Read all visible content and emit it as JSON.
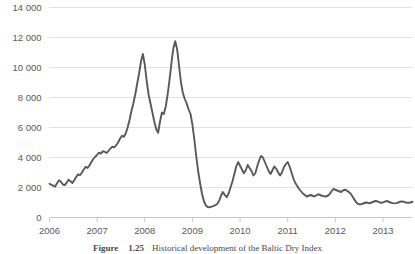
{
  "caption": {
    "label": "Figure",
    "number": "1.25",
    "text": "Historical development of the Baltic Dry Index"
  },
  "chart_data": {
    "type": "line",
    "title": "",
    "xlabel": "",
    "ylabel": "",
    "grid": true,
    "legend": "none",
    "xlim": [
      2006.0,
      2013.62
    ],
    "ylim": [
      0,
      14000
    ],
    "ytick_labels": [
      "0",
      "2 000",
      "4 000",
      "6 000",
      "8 000",
      "10 000",
      "12 000",
      "14 000"
    ],
    "ytick_values": [
      0,
      2000,
      4000,
      6000,
      8000,
      10000,
      12000,
      14000
    ],
    "xtick_labels": [
      "2006",
      "2007",
      "2008",
      "2009",
      "2010",
      "2011",
      "2012",
      "2013"
    ],
    "xtick_values": [
      2006,
      2007,
      2008,
      2009,
      2010,
      2011,
      2012,
      2013
    ],
    "series": [
      {
        "name": "Baltic Dry Index",
        "color": "#595959",
        "x": [
          2006.0,
          2006.04,
          2006.08,
          2006.12,
          2006.16,
          2006.2,
          2006.24,
          2006.28,
          2006.32,
          2006.36,
          2006.4,
          2006.44,
          2006.48,
          2006.52,
          2006.56,
          2006.6,
          2006.64,
          2006.68,
          2006.72,
          2006.76,
          2006.8,
          2006.84,
          2006.88,
          2006.92,
          2006.96,
          2007.0,
          2007.04,
          2007.08,
          2007.12,
          2007.16,
          2007.2,
          2007.24,
          2007.28,
          2007.32,
          2007.36,
          2007.4,
          2007.44,
          2007.48,
          2007.52,
          2007.56,
          2007.6,
          2007.64,
          2007.68,
          2007.72,
          2007.76,
          2007.8,
          2007.84,
          2007.88,
          2007.92,
          2007.96,
          2008.0,
          2008.04,
          2008.08,
          2008.12,
          2008.16,
          2008.2,
          2008.24,
          2008.28,
          2008.32,
          2008.36,
          2008.4,
          2008.44,
          2008.48,
          2008.52,
          2008.56,
          2008.6,
          2008.64,
          2008.68,
          2008.72,
          2008.76,
          2008.8,
          2008.84,
          2008.88,
          2008.92,
          2008.96,
          2009.0,
          2009.04,
          2009.08,
          2009.12,
          2009.16,
          2009.2,
          2009.24,
          2009.28,
          2009.32,
          2009.36,
          2009.4,
          2009.44,
          2009.48,
          2009.52,
          2009.56,
          2009.6,
          2009.64,
          2009.68,
          2009.72,
          2009.76,
          2009.8,
          2009.84,
          2009.88,
          2009.92,
          2009.96,
          2010.0,
          2010.04,
          2010.08,
          2010.12,
          2010.16,
          2010.2,
          2010.24,
          2010.28,
          2010.32,
          2010.36,
          2010.4,
          2010.44,
          2010.48,
          2010.52,
          2010.56,
          2010.6,
          2010.64,
          2010.68,
          2010.72,
          2010.76,
          2010.8,
          2010.84,
          2010.88,
          2010.92,
          2010.96,
          2011.0,
          2011.04,
          2011.08,
          2011.12,
          2011.16,
          2011.2,
          2011.24,
          2011.28,
          2011.32,
          2011.36,
          2011.4,
          2011.44,
          2011.48,
          2011.52,
          2011.56,
          2011.6,
          2011.64,
          2011.68,
          2011.72,
          2011.76,
          2011.8,
          2011.84,
          2011.88,
          2011.92,
          2011.96,
          2012.0,
          2012.04,
          2012.08,
          2012.12,
          2012.16,
          2012.2,
          2012.24,
          2012.28,
          2012.32,
          2012.36,
          2012.4,
          2012.44,
          2012.48,
          2012.52,
          2012.56,
          2012.6,
          2012.64,
          2012.68,
          2012.72,
          2012.76,
          2012.8,
          2012.84,
          2012.88,
          2012.92,
          2012.96,
          2013.0,
          2013.04,
          2013.08,
          2013.12,
          2013.16,
          2013.2,
          2013.24,
          2013.28,
          2013.32,
          2013.36,
          2013.4,
          2013.44,
          2013.48,
          2013.52,
          2013.58,
          2013.62
        ],
        "values": [
          2250,
          2180,
          2120,
          2060,
          2300,
          2480,
          2380,
          2200,
          2160,
          2320,
          2520,
          2420,
          2300,
          2480,
          2700,
          2880,
          2820,
          3000,
          3200,
          3380,
          3300,
          3480,
          3700,
          3900,
          4050,
          4180,
          4320,
          4260,
          4420,
          4380,
          4300,
          4450,
          4600,
          4720,
          4680,
          4820,
          5000,
          5250,
          5450,
          5380,
          5600,
          6000,
          6500,
          7100,
          7600,
          8200,
          8900,
          9600,
          10400,
          10900,
          10200,
          9100,
          8200,
          7600,
          7000,
          6400,
          5900,
          5650,
          6400,
          7000,
          6900,
          7400,
          8200,
          9200,
          10300,
          11300,
          11750,
          11200,
          10100,
          9000,
          8300,
          7900,
          7600,
          7200,
          6900,
          6200,
          5200,
          4100,
          3100,
          2300,
          1600,
          1100,
          820,
          700,
          680,
          720,
          760,
          820,
          900,
          1100,
          1450,
          1700,
          1500,
          1350,
          1600,
          2000,
          2400,
          2900,
          3400,
          3700,
          3450,
          3200,
          2950,
          3150,
          3500,
          3300,
          3100,
          2800,
          2950,
          3400,
          3800,
          4100,
          4000,
          3700,
          3400,
          3100,
          2900,
          3150,
          3400,
          3250,
          3000,
          2800,
          3000,
          3350,
          3550,
          3700,
          3400,
          3000,
          2600,
          2300,
          2100,
          1900,
          1750,
          1600,
          1500,
          1400,
          1450,
          1500,
          1450,
          1400,
          1480,
          1550,
          1500,
          1450,
          1420,
          1400,
          1450,
          1550,
          1750,
          1900,
          1850,
          1800,
          1750,
          1700,
          1800,
          1850,
          1800,
          1700,
          1600,
          1400,
          1200,
          1000,
          900,
          870,
          900,
          950,
          1000,
          980,
          950,
          1000,
          1050,
          1100,
          1080,
          1020,
          980,
          1000,
          1060,
          1100,
          1050,
          1000,
          960,
          940,
          960,
          1000,
          1050,
          1080,
          1040,
          1000,
          980,
          1000,
          1050
        ]
      }
    ]
  }
}
